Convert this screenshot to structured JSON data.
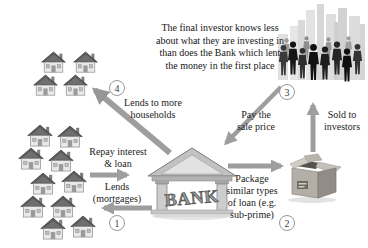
{
  "note": "The final investor knows less\nabout what they are investing in\nthan does the Bank which lent\nthe money in the first place",
  "steps": [
    {
      "number": "1",
      "label": "Lends\n(mortgages)"
    },
    {
      "number": "2",
      "label": "Package\nsimilar types\nof loan (e.g.\nsub-prime)"
    },
    {
      "number": "3",
      "label": "Pay the\nsale price"
    },
    {
      "number": "4",
      "label": "Lends to more\nhouseholds"
    }
  ],
  "labels": {
    "repay_interest": "Repay interest\n& loan",
    "sold_to_investors": "Sold to\ninvestors"
  },
  "bank": {
    "sign": "BANK"
  },
  "households": {
    "top_count": 4,
    "bottom_count": 10
  },
  "icons": {
    "households": "house-icon",
    "bank": "bank-building-icon",
    "package": "cardboard-box-icon",
    "investors": "investor-crowd-icon",
    "arrows": "flow-arrow-icon"
  },
  "colors": {
    "background": "#ffffff",
    "arrow": "#9e9e9e",
    "text": "#1b1b1b",
    "circle_ring": "#999999"
  }
}
